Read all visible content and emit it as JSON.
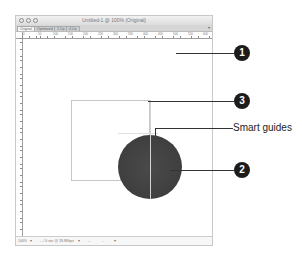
{
  "window": {
    "title": "Untitled-1 @ 100% (Original)",
    "traffic_lights": [
      "close",
      "minimize",
      "zoom"
    ],
    "tabs": [
      {
        "label": "Original",
        "active": true
      },
      {
        "label": "Optimized",
        "active": false
      },
      {
        "label": "2-Up",
        "active": false
      },
      {
        "label": "4-Up",
        "active": false
      }
    ],
    "ruler_labels": [
      "0",
      "50",
      "100",
      "150",
      "200",
      "250",
      "300",
      "350",
      "400",
      "450",
      "500",
      "550",
      "600"
    ],
    "status": {
      "zoom": "100%",
      "dimensions": "-- / 0 sec @ 28.8Kbps",
      "image_size": "--",
      "value": "--"
    }
  },
  "canvas": {
    "rectangle": {
      "stroke": "#c7c7c7"
    },
    "circle": {
      "fill": "#3f3f3f"
    }
  },
  "callouts": [
    {
      "number": "1",
      "label": ""
    },
    {
      "number": "3",
      "label": ""
    },
    {
      "number": "",
      "label": "Smart guides"
    },
    {
      "number": "2",
      "label": ""
    }
  ],
  "colors": {
    "badge": "#1c1c1c",
    "leader": "#333333"
  }
}
